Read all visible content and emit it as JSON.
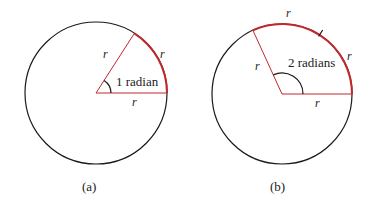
{
  "figure_a": {
    "caption": "(a)",
    "angle_label": "1 radian",
    "radius_label_upper": "r",
    "radius_label_lower": "r",
    "arc_label": "r",
    "angle_radians": 1
  },
  "figure_b": {
    "caption": "(b)",
    "angle_label": "2 radians",
    "radius_label_upper": "r",
    "radius_label_lower": "r",
    "arc_label_1": "r",
    "arc_label_2": "r",
    "angle_radians": 2
  },
  "colors": {
    "circle": "#1a1a1a",
    "highlight": "#c0282d"
  }
}
